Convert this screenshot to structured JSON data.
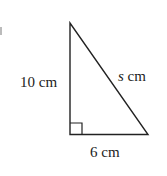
{
  "diagram": {
    "type": "right-triangle",
    "labels": {
      "vertical_side": "10 cm",
      "horizontal_side": "6 cm",
      "hypotenuse_var": "s",
      "hypotenuse_unit": " cm"
    },
    "colors": {
      "stroke": "#222222",
      "background": "#ffffff"
    }
  }
}
